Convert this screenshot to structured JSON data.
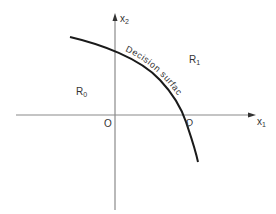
{
  "diagram": {
    "axes": {
      "x_axis_label": "x",
      "x_axis_subscript": "1",
      "y_axis_label": "x",
      "y_axis_subscript": "2",
      "origin_label": "O"
    },
    "regions": [
      {
        "name": "R",
        "subscript": "0"
      },
      {
        "name": "R",
        "subscript": "1"
      }
    ],
    "curve": {
      "label": "Decision surface",
      "intercept_label": "D"
    },
    "colors": {
      "axis": "#8a8a8a",
      "curve": "#1a1a1a",
      "text": "#333333",
      "background": "#ffffff"
    }
  }
}
